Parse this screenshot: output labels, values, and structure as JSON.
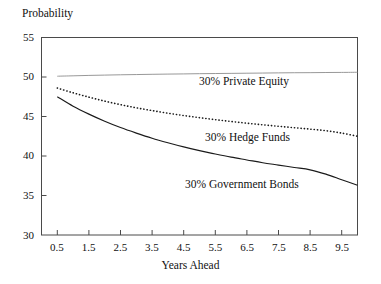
{
  "chart_data": {
    "type": "line",
    "title": "",
    "xlabel": "Years Ahead",
    "ylabel": "Probability",
    "xlim": [
      0,
      10
    ],
    "ylim": [
      30,
      55
    ],
    "grid": false,
    "legend_position": "inline-annotation",
    "xticks": [
      "0.5",
      "1.5",
      "2.5",
      "3.5",
      "4.5",
      "5.5",
      "6.5",
      "7.5",
      "8.5",
      "9.5"
    ],
    "xtick_values": [
      0.5,
      1.5,
      2.5,
      3.5,
      4.5,
      5.5,
      6.5,
      7.5,
      8.5,
      9.5
    ],
    "yticks": [
      "30",
      "35",
      "40",
      "45",
      "50",
      "55"
    ],
    "ytick_values": [
      30,
      35,
      40,
      45,
      50,
      55
    ],
    "x": [
      0.5,
      1.0,
      1.5,
      2.0,
      2.5,
      3.0,
      3.5,
      4.0,
      4.5,
      5.0,
      5.5,
      6.0,
      6.5,
      7.0,
      7.5,
      8.0,
      8.5,
      9.0,
      9.5,
      10.0
    ],
    "series": [
      {
        "name": "30% Private Equity",
        "style": "solid-thin",
        "color": "#8c8c8c",
        "values": [
          50.1,
          50.15,
          50.2,
          50.24,
          50.28,
          50.31,
          50.34,
          50.37,
          50.39,
          50.42,
          50.44,
          50.46,
          50.48,
          50.5,
          50.52,
          50.54,
          50.55,
          50.57,
          50.58,
          50.6
        ]
      },
      {
        "name": "30% Hedge Funds",
        "style": "dotted",
        "color": "#1a1a1a",
        "values": [
          48.6,
          48.0,
          47.45,
          46.95,
          46.5,
          46.1,
          45.75,
          45.42,
          45.12,
          44.85,
          44.6,
          44.37,
          44.15,
          43.95,
          43.76,
          43.58,
          43.4,
          43.2,
          42.9,
          42.5
        ]
      },
      {
        "name": "30% Government Bonds",
        "style": "solid",
        "color": "#1a1a1a",
        "values": [
          47.5,
          46.3,
          45.3,
          44.4,
          43.6,
          42.9,
          42.25,
          41.68,
          41.15,
          40.68,
          40.25,
          39.85,
          39.5,
          39.15,
          38.85,
          38.55,
          38.25,
          37.7,
          37.0,
          36.3
        ]
      }
    ],
    "annotations": [
      {
        "text": "30% Private Equity",
        "x": 5.0,
        "y": 49.0
      },
      {
        "text": "30% Hedge Funds",
        "x": 5.3,
        "y": 42.4
      },
      {
        "text": "30% Government Bonds",
        "x": 4.5,
        "y": 36.9
      }
    ]
  }
}
